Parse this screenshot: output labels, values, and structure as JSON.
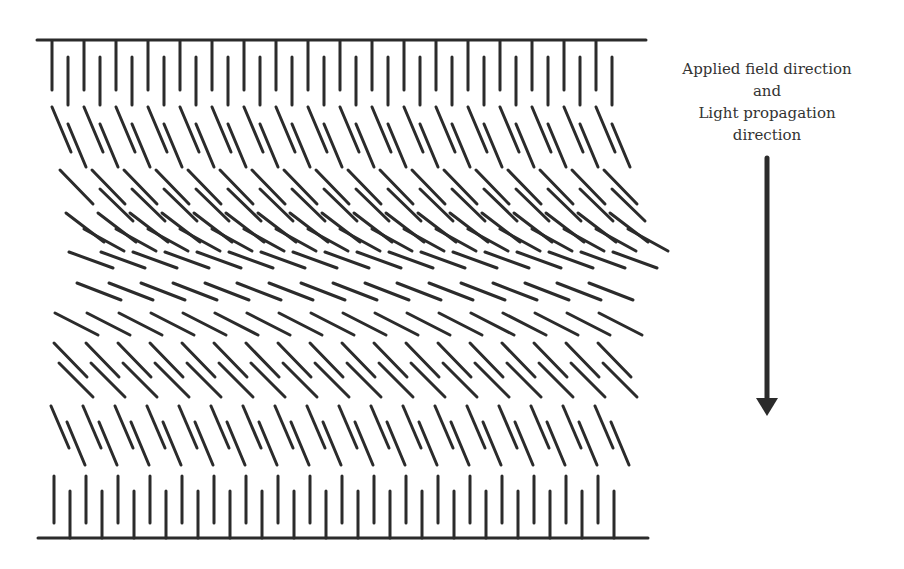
{
  "figure": {
    "type": "liquid crystal director profile (bend/splay under applied field)",
    "colors": {
      "ink": "#2b2b2b",
      "text": "#333333",
      "background": "#ffffff"
    },
    "label": {
      "lines": [
        "Applied field direction",
        "and",
        "Light propagation",
        "direction"
      ]
    },
    "arrow": {
      "x": 767,
      "y1": 158,
      "y2": 400,
      "head_tip": 416,
      "head_half_width": 11,
      "shaft_width": 5,
      "direction": "down"
    },
    "plates": [
      {
        "name": "top-substrate",
        "x1": 37,
        "x2": 646,
        "y": 40
      },
      {
        "name": "bottom-substrate",
        "x1": 38,
        "x2": 648,
        "y": 538
      }
    ],
    "rows": [
      {
        "name": "top-anchored",
        "x0": 52,
        "y0": 41,
        "dx": 0,
        "dy": 49,
        "step": 32,
        "count": 18
      },
      {
        "name": "top-offset",
        "x0": 68,
        "y0": 57,
        "dx": 0,
        "dy": 48,
        "step": 32,
        "count": 18
      },
      {
        "name": "row-a",
        "x0": 52,
        "y0": 107,
        "dx": 19,
        "dy": 45,
        "step": 32,
        "count": 18
      },
      {
        "name": "row-a-offset",
        "x0": 68,
        "y0": 124,
        "dx": 18,
        "dy": 43,
        "step": 32,
        "count": 18
      },
      {
        "name": "row-b",
        "x0": 60,
        "y0": 170,
        "dx": 33,
        "dy": 34,
        "step": 32,
        "count": 18
      },
      {
        "name": "row-b-offset",
        "x0": 100,
        "y0": 189,
        "dx": 33,
        "dy": 32,
        "step": 32,
        "count": 17
      },
      {
        "name": "row-c",
        "x0": 66,
        "y0": 213,
        "dx": 38,
        "dy": 29,
        "step": 32,
        "count": 18
      },
      {
        "name": "row-c-offset",
        "x0": 84,
        "y0": 229,
        "dx": 40,
        "dy": 22,
        "step": 32,
        "count": 18
      },
      {
        "name": "row-d",
        "x0": 69,
        "y0": 252,
        "dx": 44,
        "dy": 16,
        "step": 32,
        "count": 18
      },
      {
        "name": "row-e",
        "x0": 77,
        "y0": 283,
        "dx": 44,
        "dy": 17,
        "step": 32,
        "count": 17
      },
      {
        "name": "row-f",
        "x0": 55,
        "y0": 313,
        "dx": 43,
        "dy": 22,
        "step": 32,
        "count": 18
      },
      {
        "name": "row-g",
        "x0": 54,
        "y0": 343,
        "dx": 33,
        "dy": 34,
        "step": 32,
        "count": 18
      },
      {
        "name": "row-g-offset",
        "x0": 59,
        "y0": 363,
        "dx": 34,
        "dy": 34,
        "step": 32,
        "count": 18
      },
      {
        "name": "row-h",
        "x0": 51,
        "y0": 406,
        "dx": 18,
        "dy": 42,
        "step": 32,
        "count": 18
      },
      {
        "name": "row-h-offset",
        "x0": 67,
        "y0": 422,
        "dx": 18,
        "dy": 43,
        "step": 32,
        "count": 18
      },
      {
        "name": "bottom-offset",
        "x0": 54,
        "y0": 476,
        "dx": 0,
        "dy": 47,
        "step": 32,
        "count": 18
      },
      {
        "name": "bottom-anchored",
        "x0": 70,
        "y0": 491,
        "dx": 0,
        "dy": 47,
        "step": 32,
        "count": 18
      }
    ]
  }
}
